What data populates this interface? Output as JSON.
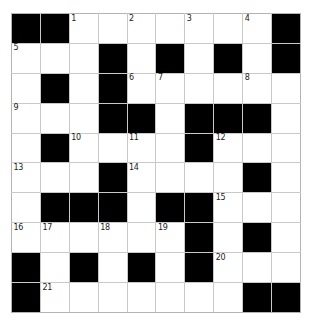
{
  "puzzle": {
    "type": "crossword-grid",
    "title": "",
    "rows": 10,
    "cols": 10,
    "cell_size_px": 29,
    "colors": {
      "block": "#000000",
      "open": "#ffffff",
      "gridline": "#c9c9c9",
      "border": "#b3b3b3",
      "number_text": "#1a1a1a",
      "page_background": "#ffffff"
    },
    "numbers_present": [
      1,
      2,
      3,
      4,
      5,
      6,
      7,
      8,
      9,
      10,
      11,
      12,
      13,
      14,
      15,
      16,
      17,
      18,
      19,
      20,
      21
    ],
    "grid": [
      [
        {
          "block": true,
          "num": null
        },
        {
          "block": true,
          "num": null
        },
        {
          "block": false,
          "num": "1"
        },
        {
          "block": false,
          "num": null
        },
        {
          "block": false,
          "num": "2"
        },
        {
          "block": false,
          "num": null
        },
        {
          "block": false,
          "num": "3"
        },
        {
          "block": false,
          "num": null
        },
        {
          "block": false,
          "num": "4"
        },
        {
          "block": true,
          "num": null
        }
      ],
      [
        {
          "block": false,
          "num": "5"
        },
        {
          "block": false,
          "num": null
        },
        {
          "block": false,
          "num": null
        },
        {
          "block": true,
          "num": null
        },
        {
          "block": false,
          "num": null
        },
        {
          "block": true,
          "num": null
        },
        {
          "block": false,
          "num": null
        },
        {
          "block": true,
          "num": null
        },
        {
          "block": false,
          "num": null
        },
        {
          "block": true,
          "num": null
        }
      ],
      [
        {
          "block": false,
          "num": null
        },
        {
          "block": true,
          "num": null
        },
        {
          "block": false,
          "num": null
        },
        {
          "block": true,
          "num": null
        },
        {
          "block": false,
          "num": "6"
        },
        {
          "block": false,
          "num": "7"
        },
        {
          "block": false,
          "num": null
        },
        {
          "block": false,
          "num": null
        },
        {
          "block": false,
          "num": "8"
        },
        {
          "block": false,
          "num": null
        }
      ],
      [
        {
          "block": false,
          "num": "9"
        },
        {
          "block": false,
          "num": null
        },
        {
          "block": false,
          "num": null
        },
        {
          "block": true,
          "num": null
        },
        {
          "block": true,
          "num": null
        },
        {
          "block": false,
          "num": null
        },
        {
          "block": true,
          "num": null
        },
        {
          "block": true,
          "num": null
        },
        {
          "block": true,
          "num": null
        },
        {
          "block": false,
          "num": null
        }
      ],
      [
        {
          "block": false,
          "num": null
        },
        {
          "block": true,
          "num": null
        },
        {
          "block": false,
          "num": "10"
        },
        {
          "block": false,
          "num": null
        },
        {
          "block": false,
          "num": "11"
        },
        {
          "block": false,
          "num": null
        },
        {
          "block": true,
          "num": null
        },
        {
          "block": false,
          "num": "12"
        },
        {
          "block": false,
          "num": null
        },
        {
          "block": false,
          "num": null
        }
      ],
      [
        {
          "block": false,
          "num": "13"
        },
        {
          "block": false,
          "num": null
        },
        {
          "block": false,
          "num": null
        },
        {
          "block": true,
          "num": null
        },
        {
          "block": false,
          "num": "14"
        },
        {
          "block": false,
          "num": null
        },
        {
          "block": false,
          "num": null
        },
        {
          "block": false,
          "num": null
        },
        {
          "block": true,
          "num": null
        },
        {
          "block": false,
          "num": null
        }
      ],
      [
        {
          "block": false,
          "num": null
        },
        {
          "block": true,
          "num": null
        },
        {
          "block": true,
          "num": null
        },
        {
          "block": true,
          "num": null
        },
        {
          "block": false,
          "num": null
        },
        {
          "block": true,
          "num": null
        },
        {
          "block": true,
          "num": null
        },
        {
          "block": false,
          "num": "15"
        },
        {
          "block": false,
          "num": null
        },
        {
          "block": false,
          "num": null
        }
      ],
      [
        {
          "block": false,
          "num": "16"
        },
        {
          "block": false,
          "num": "17"
        },
        {
          "block": false,
          "num": null
        },
        {
          "block": false,
          "num": "18"
        },
        {
          "block": false,
          "num": null
        },
        {
          "block": false,
          "num": "19"
        },
        {
          "block": true,
          "num": null
        },
        {
          "block": false,
          "num": null
        },
        {
          "block": true,
          "num": null
        },
        {
          "block": false,
          "num": null
        }
      ],
      [
        {
          "block": true,
          "num": null
        },
        {
          "block": false,
          "num": null
        },
        {
          "block": true,
          "num": null
        },
        {
          "block": false,
          "num": null
        },
        {
          "block": true,
          "num": null
        },
        {
          "block": false,
          "num": null
        },
        {
          "block": true,
          "num": null
        },
        {
          "block": false,
          "num": "20"
        },
        {
          "block": false,
          "num": null
        },
        {
          "block": false,
          "num": null
        }
      ],
      [
        {
          "block": true,
          "num": null
        },
        {
          "block": false,
          "num": "21"
        },
        {
          "block": false,
          "num": null
        },
        {
          "block": false,
          "num": null
        },
        {
          "block": false,
          "num": null
        },
        {
          "block": false,
          "num": null
        },
        {
          "block": false,
          "num": null
        },
        {
          "block": false,
          "num": null
        },
        {
          "block": true,
          "num": null
        },
        {
          "block": true,
          "num": null
        }
      ]
    ]
  }
}
